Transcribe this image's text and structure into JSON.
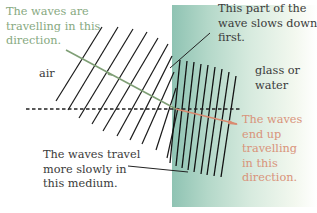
{
  "diagram": {
    "regions": {
      "air_label": "air",
      "medium_label_line1": "glass or",
      "medium_label_line2": "water"
    },
    "annotations": {
      "incident": {
        "lines": [
          "The waves are",
          "travelling in this",
          "direction."
        ],
        "color": "#87a97f"
      },
      "slows_first": {
        "lines": [
          "This part of the",
          "wave slows down",
          "first."
        ],
        "color": "#3a3a3a"
      },
      "slower": {
        "lines": [
          "The waves travel",
          "more slowly in",
          "this medium."
        ],
        "color": "#3a3a3a"
      },
      "refracted": {
        "lines": [
          "The waves",
          "end up",
          "travelling",
          "in this",
          "direction."
        ],
        "color": "#d9937a"
      }
    },
    "colors": {
      "incident_ray": "#7f9f76",
      "refracted_ray": "#d98a70",
      "wavefront": "#1a1a1a",
      "boundary_dashes": "#222222",
      "medium_gradient_start": "#8fc3b3",
      "medium_gradient_end": "#ffffff"
    }
  }
}
